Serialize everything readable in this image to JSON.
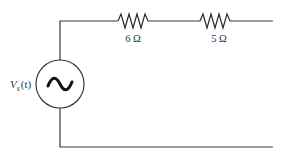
{
  "diagram": {
    "type": "circuit-schematic",
    "source": {
      "label_main": "V",
      "label_sub": "s",
      "label_arg": "(t)",
      "symbol": "~",
      "kind": "AC voltage source"
    },
    "resistors": [
      {
        "label": "6 Ω",
        "value_ohms": 6
      },
      {
        "label": "5 Ω",
        "value_ohms": 5
      }
    ],
    "terminals": "open (right side)"
  }
}
